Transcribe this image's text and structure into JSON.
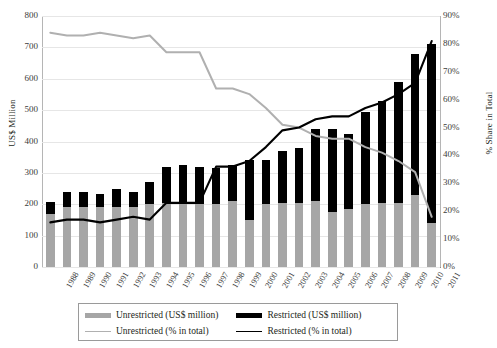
{
  "chart_data": {
    "type": "bar",
    "title": "",
    "subtitle": "",
    "xlabel": "",
    "ylabel": "US$ Million",
    "y2label": "% Share in Total",
    "grid": true,
    "legend_position": "bottom",
    "ylim": [
      0,
      800
    ],
    "y2lim": [
      0,
      90
    ],
    "yticks": [
      "0",
      "100",
      "200",
      "300",
      "400",
      "500",
      "600",
      "700",
      "800"
    ],
    "ytick_values": [
      0,
      100,
      200,
      300,
      400,
      500,
      600,
      700,
      800
    ],
    "y2ticks": [
      "0%",
      "10%",
      "20%",
      "30%",
      "40%",
      "50%",
      "60%",
      "70%",
      "80%",
      "90%"
    ],
    "y2tick_values": [
      0,
      10,
      20,
      30,
      40,
      50,
      60,
      70,
      80,
      90
    ],
    "categories": [
      "1988",
      "1989",
      "1990",
      "1991",
      "1992",
      "1993",
      "1994",
      "1995",
      "1996",
      "1997",
      "1998",
      "1999",
      "2000",
      "2001",
      "2002",
      "2003",
      "2004",
      "2005",
      "2006",
      "2007",
      "2008",
      "2009",
      "2010",
      "2011"
    ],
    "series": [
      {
        "name": "Unrestricted (US$ million)",
        "type": "bar",
        "stack": "total",
        "axis": "left",
        "color": "#a6a6a6",
        "values": [
          170,
          190,
          190,
          190,
          190,
          190,
          200,
          205,
          205,
          200,
          200,
          210,
          150,
          200,
          205,
          205,
          210,
          175,
          185,
          200,
          205,
          205,
          230,
          140
        ]
      },
      {
        "name": "Restricted (US$ million)",
        "type": "bar",
        "stack": "total",
        "axis": "left",
        "color": "#000000",
        "values": [
          38,
          48,
          48,
          42,
          58,
          48,
          70,
          115,
          120,
          120,
          115,
          115,
          190,
          140,
          165,
          175,
          230,
          265,
          240,
          295,
          325,
          385,
          450,
          570
        ]
      },
      {
        "name": "Unrestricted (% in total)",
        "type": "line",
        "axis": "right",
        "color": "#b0b0b0",
        "values": [
          84,
          83,
          83,
          84,
          83,
          82,
          83,
          77,
          77,
          77,
          64,
          64,
          62,
          57,
          51,
          50,
          47,
          46,
          46,
          43,
          41,
          38,
          34,
          18
        ]
      },
      {
        "name": "Restricted (% in total)",
        "type": "line",
        "axis": "right",
        "color": "#000000",
        "values": [
          16,
          17,
          17,
          16,
          17,
          18,
          17,
          23,
          23,
          23,
          36,
          36,
          38,
          43,
          49,
          50,
          53,
          54,
          54,
          57,
          59,
          62,
          66,
          81
        ]
      }
    ],
    "legend_entries": [
      {
        "label": "Unrestricted (US$ million)",
        "marker": "bar",
        "color": "#a6a6a6"
      },
      {
        "label": "Restricted (US$ million)",
        "marker": "bar",
        "color": "#000000"
      },
      {
        "label": "Unrestricted (% in total)",
        "marker": "line",
        "color": "#b0b0b0"
      },
      {
        "label": "Restricted (% in total)",
        "marker": "line",
        "color": "#000000"
      }
    ]
  }
}
